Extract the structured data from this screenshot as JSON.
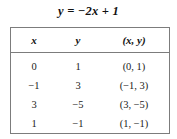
{
  "title": "y = −2x + 1",
  "table": {
    "headers": [
      "x",
      "y",
      "(x, y)"
    ],
    "rows": [
      {
        "x": "0",
        "y": "1",
        "pair": "(0, 1)"
      },
      {
        "x": "−1",
        "y": "3",
        "pair": "(−1, 3)"
      },
      {
        "x": "3",
        "y": "−5",
        "pair": "(3, −5)"
      },
      {
        "x": "1",
        "y": "−1",
        "pair": "(1, −1)"
      }
    ]
  },
  "colors": {
    "border": "#7c7c7c",
    "text": "#1a1a1a",
    "background": "#ffffff"
  }
}
